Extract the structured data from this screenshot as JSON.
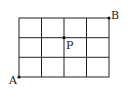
{
  "diagram": {
    "type": "grid",
    "columns": 4,
    "rows": 3,
    "line_color": "#222222",
    "points": [
      {
        "label": "A",
        "position": "bottom-left corner"
      },
      {
        "label": "B",
        "position": "top-right corner"
      },
      {
        "label": "P",
        "position": "interior grid point, 2 right from left edge, 1 down from top"
      }
    ]
  }
}
